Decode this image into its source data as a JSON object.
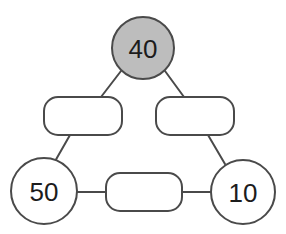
{
  "canvas": {
    "width": 286,
    "height": 234,
    "background": "#ffffff"
  },
  "style": {
    "stroke_color": "#4a4a4a",
    "stroke_width": 2,
    "filled_node_color": "#bdbdbd",
    "empty_node_color": "#ffffff",
    "text_color": "#1c1c1c"
  },
  "diagram": {
    "type": "number-triangle-puzzle",
    "nodes": [
      {
        "id": "top-circle",
        "shape": "circle",
        "label": "40",
        "filled": true,
        "fill": "#bdbdbd",
        "cx": 143,
        "cy": 48,
        "r": 31
      },
      {
        "id": "left-box",
        "shape": "rounded-rect",
        "label": "",
        "filled": false,
        "fill": "#ffffff",
        "x": 44,
        "y": 97,
        "width": 78,
        "height": 38,
        "rx": 14
      },
      {
        "id": "right-box",
        "shape": "rounded-rect",
        "label": "",
        "filled": false,
        "fill": "#ffffff",
        "x": 156,
        "y": 97,
        "width": 78,
        "height": 38,
        "rx": 14
      },
      {
        "id": "bottom-left-circle",
        "shape": "circle",
        "label": "50",
        "filled": false,
        "fill": "#ffffff",
        "cx": 44,
        "cy": 191,
        "r": 33
      },
      {
        "id": "bottom-box",
        "shape": "rounded-rect",
        "label": "",
        "filled": false,
        "fill": "#ffffff",
        "x": 106,
        "y": 173,
        "width": 76,
        "height": 38,
        "rx": 14
      },
      {
        "id": "bottom-right-circle",
        "shape": "circle",
        "label": "10",
        "filled": false,
        "fill": "#ffffff",
        "cx": 243,
        "cy": 192,
        "r": 32
      }
    ],
    "edges": [
      {
        "id": "edge-top-to-left-box",
        "from": "top-circle",
        "to": "left-box",
        "x1": 121,
        "y1": 71,
        "x2": 101,
        "y2": 97
      },
      {
        "id": "edge-top-to-right-box",
        "from": "top-circle",
        "to": "right-box",
        "x1": 165,
        "y1": 71,
        "x2": 184,
        "y2": 97
      },
      {
        "id": "edge-left-box-to-bl",
        "from": "left-box",
        "to": "bottom-left-circle",
        "x1": 70,
        "y1": 135,
        "x2": 54,
        "y2": 163
      },
      {
        "id": "edge-right-box-to-br",
        "from": "right-box",
        "to": "bottom-right-circle",
        "x1": 208,
        "y1": 135,
        "x2": 225,
        "y2": 164
      },
      {
        "id": "edge-bl-to-bottom-box",
        "from": "bottom-left-circle",
        "to": "bottom-box",
        "x1": 77,
        "y1": 192,
        "x2": 106,
        "y2": 192
      },
      {
        "id": "edge-bottom-box-to-br",
        "from": "bottom-box",
        "to": "bottom-right-circle",
        "x1": 182,
        "y1": 192,
        "x2": 211,
        "y2": 192
      }
    ],
    "visible_numbers": [
      "40",
      "50",
      "10"
    ],
    "empty_slot_count": 3
  }
}
